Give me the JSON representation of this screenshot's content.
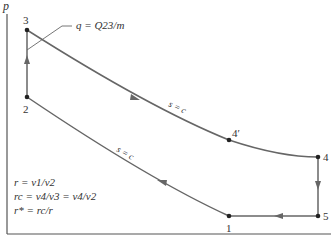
{
  "axes": {
    "y_label": "p",
    "x_label": ""
  },
  "points": {
    "p1": {
      "label": "1",
      "x": 229,
      "y": 216
    },
    "p2": {
      "label": "2",
      "x": 27,
      "y": 97
    },
    "p3": {
      "label": "3",
      "x": 27,
      "y": 30
    },
    "p4prime": {
      "label": "4′",
      "x": 229,
      "y": 140
    },
    "p4": {
      "label": "4",
      "x": 318,
      "y": 157
    },
    "p5": {
      "label": "5",
      "x": 318,
      "y": 216
    }
  },
  "annotations": {
    "heat_input": "q = Q23/m",
    "isentrope_upper": "s = c",
    "isentrope_lower": "s = c"
  },
  "equations": [
    "r = v1/v2",
    "rc = v4/v3 = v4/v2",
    "r* = rc/r"
  ],
  "colors": {
    "curve": "#555555",
    "axis": "#555555",
    "text": "#333333"
  }
}
